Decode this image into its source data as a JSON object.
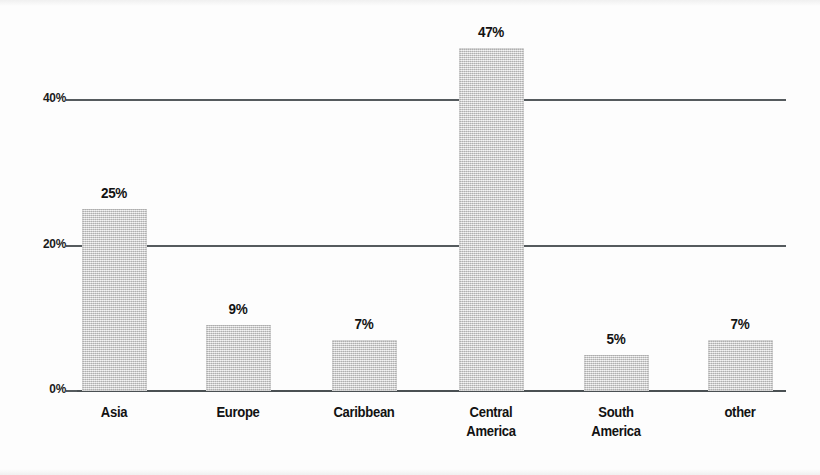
{
  "chart_data": {
    "type": "bar",
    "title": "",
    "subtitle": "",
    "xlabel": "",
    "ylabel": "",
    "ylim": [
      0,
      50
    ],
    "grid": true,
    "legend": null,
    "y_ticks": [
      "0%",
      "20%",
      "40%"
    ],
    "y_tick_values": [
      0,
      20,
      40
    ],
    "categories": [
      "Asia",
      "Europe",
      "Caribbean",
      "Central America",
      "South America",
      "other"
    ],
    "values": [
      25,
      9,
      7,
      47,
      5,
      7
    ],
    "data_labels": [
      "25%",
      "9%",
      "7%",
      "47%",
      "5%",
      "7%"
    ],
    "bars": [
      {
        "label": "Asia",
        "label_line1": "Asia",
        "label_line2": "",
        "value": 25,
        "value_label": "25%"
      },
      {
        "label": "Europe",
        "label_line1": "Europe",
        "label_line2": "",
        "value": 9,
        "value_label": "9%"
      },
      {
        "label": "Caribbean",
        "label_line1": "Caribbean",
        "label_line2": "",
        "value": 7,
        "value_label": "7%"
      },
      {
        "label": "Central America",
        "label_line1": "Central",
        "label_line2": "America",
        "value": 47,
        "value_label": "47%"
      },
      {
        "label": "South America",
        "label_line1": "South",
        "label_line2": "America",
        "value": 5,
        "value_label": "5%"
      },
      {
        "label": "other",
        "label_line1": "other",
        "label_line2": "",
        "value": 7,
        "value_label": "7%"
      }
    ],
    "colors": {
      "bar_fill": "#d2d2d2",
      "gridline": "#555b5e",
      "axis": "#4a5053",
      "text": "#121212",
      "background": "#ffffff"
    }
  }
}
